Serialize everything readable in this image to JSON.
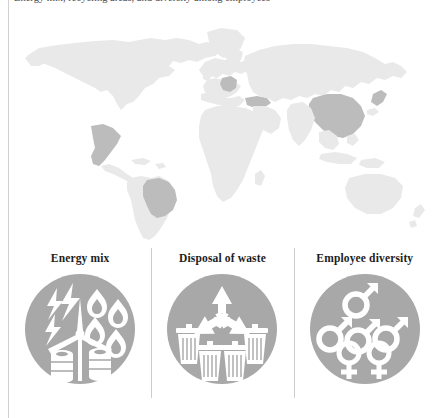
{
  "document": {
    "caption_text": "Energy mix, recycling areas, and diversity among employees"
  },
  "map": {
    "name": "world-map",
    "land_color": "#e9e9e9",
    "highlight_color": "#bcbcbc",
    "background_color": "#ffffff",
    "highlighted_countries": [
      "Mexico",
      "Brazil",
      "Germany",
      "Turkey",
      "China"
    ]
  },
  "panels": [
    {
      "title": "Energy mix",
      "icon": "energy-mix-icon",
      "circle_color": "#a8a8a8",
      "glyph_color": "#ffffff",
      "elements": [
        "lightning-bolt",
        "lightning-bolt",
        "lightning-bolt",
        "wind-turbine",
        "flame",
        "flame",
        "flame",
        "oil-barrel",
        "oil-barrel"
      ]
    },
    {
      "title": "Disposal of waste",
      "icon": "disposal-of-waste-icon",
      "circle_color": "#a8a8a8",
      "glyph_color": "#ffffff",
      "elements": [
        "recycling-symbol",
        "trash-bin",
        "trash-bin",
        "trash-bin",
        "trash-bin"
      ]
    },
    {
      "title": "Employee diversity",
      "icon": "employee-diversity-icon",
      "circle_color": "#a8a8a8",
      "glyph_color": "#ffffff",
      "elements": [
        "male-symbol",
        "male-symbol",
        "male-symbol",
        "male-symbol",
        "female-symbol",
        "female-symbol"
      ]
    }
  ]
}
